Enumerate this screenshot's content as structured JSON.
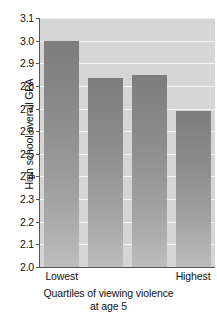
{
  "chart_data": {
    "type": "bar",
    "title": "",
    "categories": [
      "Lowest",
      "",
      "",
      "Highest"
    ],
    "values": [
      3.0,
      2.835,
      2.848,
      2.69
    ],
    "xlabel": "Quartiles of viewing violence at age 5",
    "xlabel_line1": "Quartiles of viewing violence",
    "xlabel_line2": "at age 5",
    "ylabel": "High school overall GPA",
    "ylim": [
      2.0,
      3.1
    ],
    "ytick_labels": [
      "2.0",
      "2.1",
      "2.2",
      "2.3",
      "2.4",
      "2.5",
      "2.6",
      "2.7",
      "2.8",
      "2.9",
      "3.0",
      "3.1"
    ],
    "ytick_values": [
      2.0,
      2.1,
      2.2,
      2.3,
      2.4,
      2.5,
      2.6,
      2.7,
      2.8,
      2.9,
      3.0,
      3.1
    ],
    "xtick_labels": [
      "Lowest",
      "Highest"
    ],
    "grid": true,
    "legend": false,
    "colors": {
      "plot_background": "#d5d5d5",
      "gridline": "#f4f4f4",
      "bar_top": "#7d7d7d",
      "bar_bottom": "#bdbdbd",
      "axis": "#555555",
      "text": "#111111"
    }
  }
}
